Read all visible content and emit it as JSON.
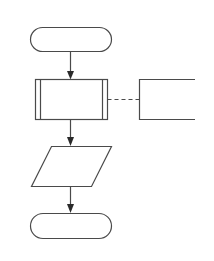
{
  "diagram": {
    "type": "flowchart",
    "colors": {
      "stroke": "#4a4a4a",
      "fill": "#ffffff",
      "background": "#ffffff"
    },
    "nodes": [
      {
        "id": "start",
        "shape": "terminator",
        "label": ""
      },
      {
        "id": "process",
        "shape": "predefined-process",
        "label": ""
      },
      {
        "id": "annotation",
        "shape": "annotation-bracket",
        "label": ""
      },
      {
        "id": "data",
        "shape": "parallelogram",
        "label": ""
      },
      {
        "id": "end",
        "shape": "terminator",
        "label": ""
      }
    ],
    "edges": [
      {
        "from": "start",
        "to": "process",
        "style": "solid-arrow"
      },
      {
        "from": "process",
        "to": "annotation",
        "style": "dashed"
      },
      {
        "from": "process",
        "to": "data",
        "style": "solid-arrow"
      },
      {
        "from": "data",
        "to": "end",
        "style": "solid-arrow"
      }
    ]
  }
}
